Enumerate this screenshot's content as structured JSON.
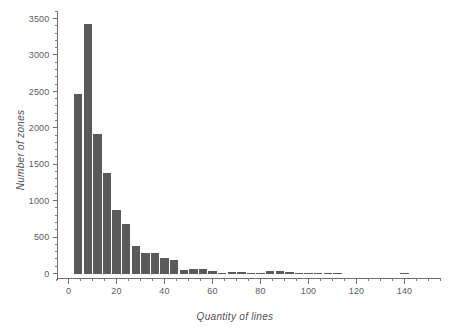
{
  "chart_data": {
    "type": "bar",
    "title": "",
    "subtitle": "",
    "xlabel": "Quantity of lines",
    "ylabel": "Number of zones",
    "xlim": [
      -5,
      155
    ],
    "ylim": [
      0,
      3600
    ],
    "grid": false,
    "legend": null,
    "bar_color": "#5a5a5a",
    "axis_color": "#6e6e6e",
    "bin_width": 4,
    "x_ticks_major": [
      0,
      20,
      40,
      60,
      80,
      100,
      120,
      140
    ],
    "x_tick_labels": [
      "0",
      "20",
      "40",
      "60",
      "80",
      "100",
      "120",
      "140"
    ],
    "x_tick_minor_step": 5,
    "y_ticks_major": [
      0,
      500,
      1000,
      1500,
      2000,
      2500,
      3000,
      3500
    ],
    "y_tick_labels": [
      "0",
      "500",
      "1000",
      "1500",
      "2000",
      "2500",
      "3000",
      "3500"
    ],
    "y_tick_minor_step": 100,
    "x": [
      4,
      8,
      12,
      16,
      20,
      24,
      28,
      32,
      36,
      40,
      44,
      48,
      52,
      56,
      60,
      64,
      68,
      72,
      76,
      80,
      84,
      88,
      92,
      96,
      100,
      104,
      108,
      112,
      140
    ],
    "categories": [
      "2-6",
      "6-10",
      "10-14",
      "14-18",
      "18-22",
      "22-26",
      "26-30",
      "30-34",
      "34-38",
      "38-42",
      "42-46",
      "46-50",
      "50-54",
      "54-58",
      "58-62",
      "62-66",
      "66-70",
      "70-74",
      "74-78",
      "78-82",
      "82-86",
      "86-90",
      "90-94",
      "94-98",
      "98-102",
      "102-106",
      "106-110",
      "110-114",
      "138-142"
    ],
    "values": [
      2460,
      3430,
      1920,
      1380,
      870,
      675,
      380,
      275,
      285,
      210,
      185,
      45,
      65,
      65,
      30,
      12,
      15,
      18,
      12,
      10,
      28,
      30,
      22,
      10,
      8,
      8,
      8,
      8,
      10
    ]
  }
}
